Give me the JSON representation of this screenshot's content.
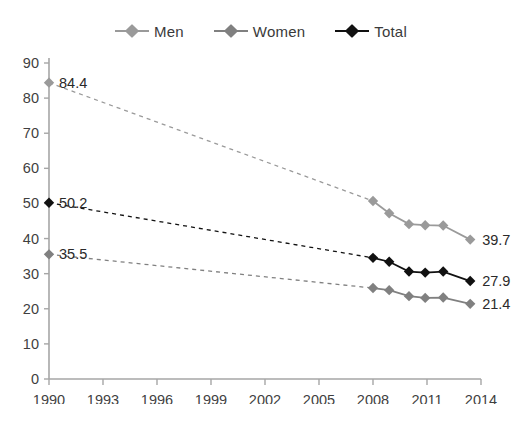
{
  "chart_data": {
    "type": "line",
    "title": "",
    "subtitle": "",
    "xlabel": "",
    "ylabel": "",
    "xlim": [
      1990,
      2014
    ],
    "ylim": [
      0,
      90
    ],
    "ytick_step": 10,
    "xtick_step": 3,
    "grid": false,
    "legend_position": "top-center",
    "xticks": [
      "1990",
      "1993",
      "1996",
      "1999",
      "2002",
      "2005",
      "2008",
      "2011",
      "2014"
    ],
    "yticks": [
      "0",
      "10",
      "20",
      "30",
      "40",
      "50",
      "60",
      "70",
      "80",
      "90"
    ],
    "series": [
      {
        "name": "Men",
        "color": "#9a9a9a",
        "marker": "diamond",
        "x": [
          1990,
          2008,
          2008.9,
          2010,
          2010.9,
          2011.9,
          2013.4
        ],
        "values": [
          84.4,
          50.7,
          47.2,
          44.1,
          43.8,
          43.7,
          39.7
        ],
        "dashed_segment": [
          1990,
          2008
        ],
        "start_label": "84.4",
        "end_label": "39.7"
      },
      {
        "name": "Women",
        "color": "#808080",
        "marker": "diamond",
        "x": [
          1990,
          2008,
          2008.9,
          2010,
          2010.9,
          2011.9,
          2013.4
        ],
        "values": [
          35.5,
          25.9,
          25.3,
          23.6,
          23.1,
          23.2,
          21.4
        ],
        "dashed_segment": [
          1990,
          2008
        ],
        "start_label": "35.5",
        "end_label": "21.4"
      },
      {
        "name": "Total",
        "color": "#111111",
        "marker": "diamond",
        "x": [
          1990,
          2008,
          2008.9,
          2010,
          2010.9,
          2011.9,
          2013.4
        ],
        "values": [
          50.2,
          34.5,
          33.4,
          30.6,
          30.3,
          30.6,
          27.9
        ],
        "dashed_segment": [
          1990,
          2008
        ],
        "start_label": "50.2",
        "end_label": "27.9"
      }
    ],
    "annotations": [
      {
        "text": "84.4",
        "series": "Men",
        "position": "left"
      },
      {
        "text": "50.2",
        "series": "Total",
        "position": "left"
      },
      {
        "text": "35.5",
        "series": "Women",
        "position": "left"
      },
      {
        "text": "39.7",
        "series": "Men",
        "position": "right"
      },
      {
        "text": "27.9",
        "series": "Total",
        "position": "right"
      },
      {
        "text": "21.4",
        "series": "Women",
        "position": "right"
      }
    ]
  },
  "legend": {
    "items": [
      {
        "label": "Men",
        "color": "#9a9a9a"
      },
      {
        "label": "Women",
        "color": "#808080"
      },
      {
        "label": "Total",
        "color": "#111111"
      }
    ]
  },
  "axis_color": "#a6a6a6",
  "caption": ""
}
